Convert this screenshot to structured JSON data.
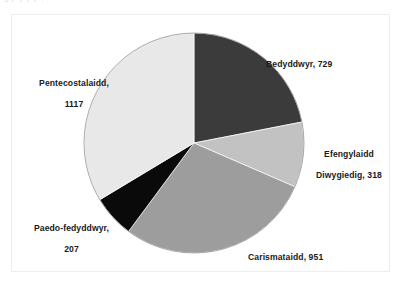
{
  "clipped_top_text": "g   p  y    y   p                          ,",
  "chart_data": {
    "type": "pie",
    "title": "",
    "subtitle": "",
    "xlabel": "",
    "ylabel": "",
    "legend_position": "none",
    "grid": false,
    "total": 3322,
    "start_angle_deg": 0,
    "direction": "clockwise",
    "categories": [
      "Bedyddwyr",
      "Efengylaidd Diwygiedig",
      "Carismataidd",
      "Paedo-fedyddwyr",
      "Pentecostalaidd"
    ],
    "values": [
      729,
      318,
      951,
      207,
      1117
    ],
    "colors": [
      "#3b3b3b",
      "#c2c2c2",
      "#9d9d9d",
      "#0a0a0a",
      "#e8e8e8"
    ],
    "slices": [
      {
        "name": "Bedyddwyr",
        "value": 729,
        "label": "Bedyddwyr, 729",
        "label_line1": "Bedyddwyr, 729",
        "label_line2": "",
        "color": "#3b3b3b",
        "percent": 21.9,
        "start_deg": 0,
        "sweep_deg": 79.0
      },
      {
        "name": "Efengylaidd Diwygiedig",
        "value": 318,
        "label": "Efengylaidd Diwygiedig, 318",
        "label_line1": "Efengylaidd",
        "label_line2": "Diwygiedig, 318",
        "color": "#c2c2c2",
        "percent": 9.6,
        "start_deg": 79.0,
        "sweep_deg": 34.5
      },
      {
        "name": "Carismataidd",
        "value": 951,
        "label": "Carismataidd, 951",
        "label_line1": "Carismataidd, 951",
        "label_line2": "",
        "color": "#9d9d9d",
        "percent": 28.6,
        "start_deg": 113.5,
        "sweep_deg": 103.1
      },
      {
        "name": "Paedo-fedyddwyr",
        "value": 207,
        "label": "Paedo-fedyddwyr, 207",
        "label_line1": "Paedo-fedyddwyr,",
        "label_line2": "207",
        "color": "#0a0a0a",
        "percent": 6.2,
        "start_deg": 216.6,
        "sweep_deg": 22.4
      },
      {
        "name": "Pentecostalaidd",
        "value": 1117,
        "label": "Pentecostalaidd, 1117",
        "label_line1": "Pentecostalaidd,",
        "label_line2": "1117",
        "color": "#e8e8e8",
        "percent": 33.6,
        "start_deg": 239.0,
        "sweep_deg": 121.0
      }
    ]
  },
  "geometry": {
    "center_x": 194,
    "center_y": 143,
    "radius": 110
  },
  "frame": {
    "border_color": "#ededed",
    "background": "#ffffff"
  }
}
